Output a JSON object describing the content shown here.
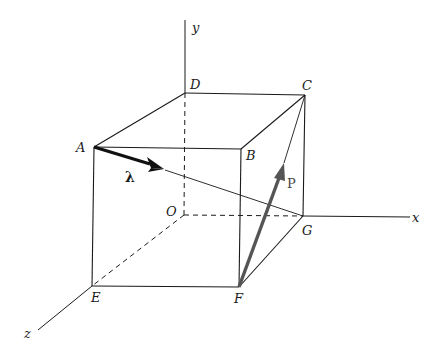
{
  "diagram": {
    "axes": {
      "x": "x",
      "y": "y",
      "z": "z"
    },
    "points": {
      "A": "A",
      "B": "B",
      "C": "C",
      "D": "D",
      "E": "E",
      "F": "F",
      "G": "G",
      "O": "O"
    },
    "vectors": {
      "lambda": "λ",
      "P": "P"
    },
    "colors": {
      "lines": "#1a1a1a",
      "force": "#555555",
      "background": "#ffffff"
    }
  }
}
